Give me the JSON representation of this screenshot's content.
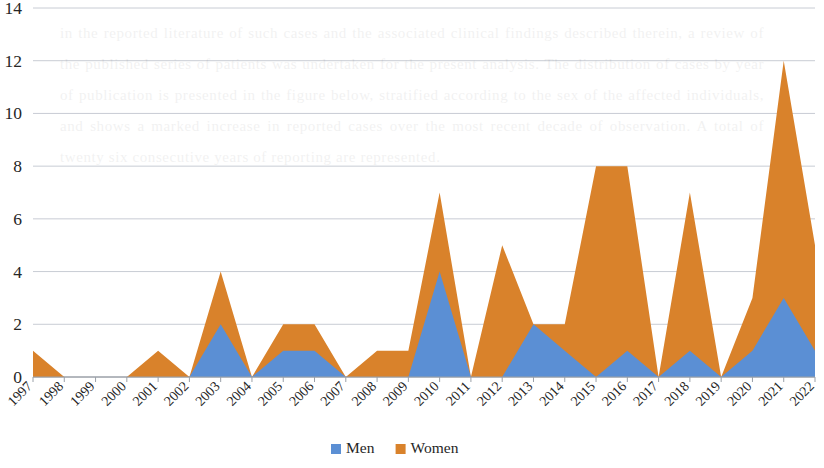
{
  "chart_data": {
    "type": "area",
    "stacked": true,
    "title": "",
    "subtitle": "",
    "xlabel": "",
    "ylabel": "",
    "categories": [
      "1997",
      "1998",
      "1999",
      "2000",
      "2001",
      "2002",
      "2003",
      "2004",
      "2005",
      "2006",
      "2007",
      "2008",
      "2009",
      "2010",
      "2011",
      "2012",
      "2013",
      "2014",
      "2015",
      "2016",
      "2017",
      "2018",
      "2019",
      "2020",
      "2021",
      "2022"
    ],
    "series": [
      {
        "name": "Men",
        "color": "#5b8fd4",
        "values": [
          0,
          0,
          0,
          0,
          0,
          0,
          2,
          0,
          1,
          1,
          0,
          0,
          0,
          4,
          0,
          0,
          2,
          1,
          0,
          1,
          0,
          1,
          0,
          1,
          3,
          1
        ]
      },
      {
        "name": "Women",
        "color": "#d9822b",
        "values": [
          1,
          0,
          0,
          0,
          1,
          0,
          2,
          0,
          1,
          1,
          0,
          1,
          1,
          3,
          0,
          5,
          0,
          1,
          8,
          7,
          0,
          6,
          0,
          2,
          9,
          4
        ]
      }
    ],
    "totals": [
      1,
      0,
      0,
      0,
      1,
      0,
      4,
      0,
      2,
      2,
      0,
      1,
      1,
      7,
      0,
      5,
      2,
      2,
      8,
      8,
      0,
      7,
      0,
      3,
      12,
      5
    ],
    "ylim": [
      0,
      14
    ],
    "yticks": [
      0,
      2,
      4,
      6,
      8,
      10,
      12,
      14
    ],
    "ytick_labels": [
      "0",
      "2",
      "4",
      "6",
      "8",
      "10",
      "12",
      "14"
    ],
    "grid": true,
    "legend_position": "bottom",
    "legend": [
      {
        "label": "Men",
        "color": "#5b8fd4"
      },
      {
        "label": "Women",
        "color": "#d9822b"
      }
    ]
  },
  "background_text": "in the reported literature of such cases and the associated clinical findings described therein, a review of the published series of patients was undertaken for the present analysis. The distribution of cases by year of publication is presented in the figure below, stratified according to the sex of the affected individuals, and shows a marked increase in reported cases over the most recent decade of observation. A total of twenty six consecutive years of reporting are represented."
}
